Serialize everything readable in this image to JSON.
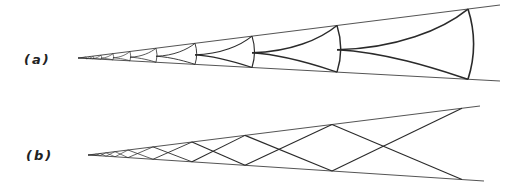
{
  "figure": {
    "stroke_color": "#2a2a2a",
    "edge_color": "#555555",
    "panels": [
      {
        "id": "a",
        "label": "(a)",
        "label_pos": [
          24,
          64
        ],
        "type": "trumpet-cells",
        "apex": [
          78,
          58
        ],
        "top_end": [
          500,
          5
        ],
        "bottom_end": [
          500,
          81
        ],
        "cell_x": [
          86,
          90,
          93,
          101,
          113,
          130,
          156,
          195,
          252,
          337,
          468
        ]
      },
      {
        "id": "b",
        "label": "(b)",
        "label_pos": [
          26,
          160
        ],
        "type": "zigzag-lattice",
        "apex": [
          88,
          155
        ],
        "top_end": [
          480,
          106
        ],
        "bottom_end": [
          484,
          181
        ],
        "vertex_x": [
          90,
          93,
          96,
          100,
          106,
          115,
          128,
          153,
          192,
          245,
          332,
          462
        ]
      }
    ]
  }
}
